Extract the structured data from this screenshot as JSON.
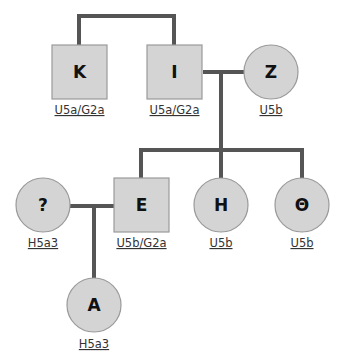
{
  "diagram": {
    "type": "pedigree",
    "colors": {
      "line": "#555555",
      "fill": "#d4d4d4",
      "stroke": "#9a9a9a",
      "label": "#111111",
      "haplogroup": "#333333"
    },
    "individuals": [
      {
        "id": "K",
        "label": "K",
        "sex": "male",
        "shape": "square",
        "haplogroup": "U5a/G2a"
      },
      {
        "id": "I",
        "label": "I",
        "sex": "male",
        "shape": "square",
        "haplogroup": "U5a/G2a"
      },
      {
        "id": "Z",
        "label": "Z",
        "sex": "female",
        "shape": "circle",
        "haplogroup": "U5b"
      },
      {
        "id": "Q",
        "label": "?",
        "sex": "female",
        "shape": "circle",
        "haplogroup": "H5a3"
      },
      {
        "id": "E",
        "label": "E",
        "sex": "male",
        "shape": "square",
        "haplogroup": "U5b/G2a"
      },
      {
        "id": "H",
        "label": "H",
        "sex": "female",
        "shape": "circle",
        "haplogroup": "U5b"
      },
      {
        "id": "TH",
        "label": "Θ",
        "sex": "female",
        "shape": "circle",
        "haplogroup": "U5b"
      },
      {
        "id": "A",
        "label": "A",
        "sex": "female",
        "shape": "circle",
        "haplogroup": "H5a3"
      }
    ],
    "relationships": [
      {
        "type": "siblings",
        "members": [
          "K",
          "I"
        ]
      },
      {
        "type": "couple",
        "members": [
          "I",
          "Z"
        ],
        "children": [
          "E",
          "H",
          "TH"
        ]
      },
      {
        "type": "couple",
        "members": [
          "Q",
          "E"
        ],
        "children": [
          "A"
        ]
      }
    ]
  }
}
